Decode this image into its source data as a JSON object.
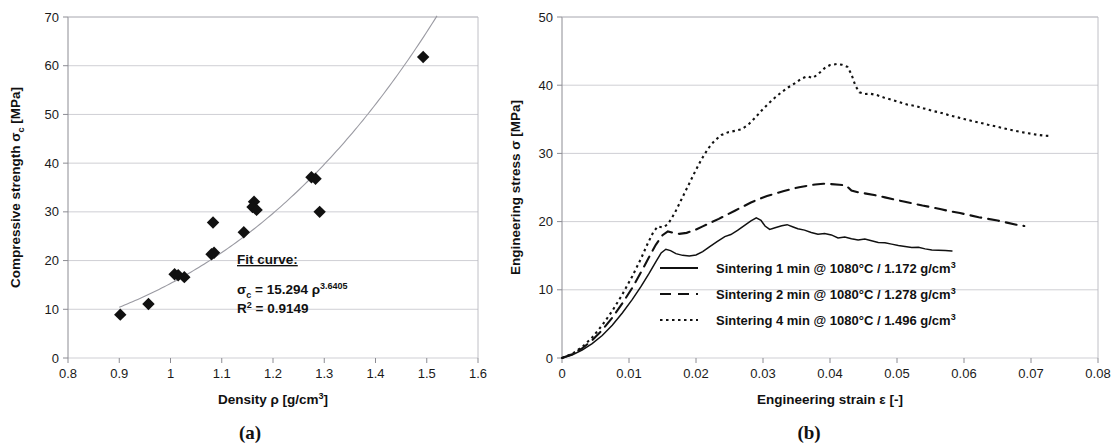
{
  "figure": {
    "panels": [
      {
        "caption": "(a)"
      },
      {
        "caption": "(b)"
      }
    ]
  },
  "chart_data": [
    {
      "type": "scatter",
      "panel": "a",
      "title": "",
      "xlabel": "Density ρ [g/cm³]",
      "xlabel_main": "Density ρ [g/cm",
      "xlabel_sup": "3",
      "xlabel_tail": "]",
      "ylabel_main": "Compressive strength σ",
      "ylabel_sub": "c",
      "ylabel_tail": " [MPa]",
      "ylabel": "Compressive strength σc [MPa]",
      "xlim": [
        0.8,
        1.6
      ],
      "ylim": [
        0,
        70
      ],
      "xticks": [
        "0.8",
        "0.9",
        "1",
        "1.1",
        "1.2",
        "1.3",
        "1.4",
        "1.5",
        "1.6"
      ],
      "xtick_values": [
        0.8,
        0.9,
        1.0,
        1.1,
        1.2,
        1.3,
        1.4,
        1.5,
        1.6
      ],
      "yticks": [
        "0",
        "10",
        "20",
        "30",
        "40",
        "50",
        "60",
        "70"
      ],
      "ytick_values": [
        0,
        10,
        20,
        30,
        40,
        50,
        60,
        70
      ],
      "grid": "horizontal",
      "marker": "diamond",
      "marker_color": "#111111",
      "points": [
        {
          "x": 0.902,
          "y": 8.9
        },
        {
          "x": 0.957,
          "y": 11.1
        },
        {
          "x": 1.008,
          "y": 17.2
        },
        {
          "x": 1.015,
          "y": 17.0
        },
        {
          "x": 1.027,
          "y": 16.6
        },
        {
          "x": 1.08,
          "y": 21.3
        },
        {
          "x": 1.085,
          "y": 21.6
        },
        {
          "x": 1.083,
          "y": 27.8
        },
        {
          "x": 1.143,
          "y": 25.8
        },
        {
          "x": 1.163,
          "y": 32.1
        },
        {
          "x": 1.16,
          "y": 31.0
        },
        {
          "x": 1.168,
          "y": 30.4
        },
        {
          "x": 1.275,
          "y": 37.1
        },
        {
          "x": 1.283,
          "y": 36.8
        },
        {
          "x": 1.291,
          "y": 30.0
        },
        {
          "x": 1.493,
          "y": 61.8
        }
      ],
      "fit": {
        "heading": "Fit curve:",
        "equation_lhs": "σ",
        "equation_lhs_sub": "c",
        "equation_mid": " = 15.294 ρ",
        "equation_exp": "3.6405",
        "coefficient": 15.294,
        "exponent": 3.6405,
        "r2_label": "R",
        "r2_sup": "2",
        "r2_value": " = 0.9149",
        "r_squared": 0.9149,
        "curve_xrange": [
          0.9,
          1.52
        ]
      }
    },
    {
      "type": "line",
      "panel": "b",
      "title": "",
      "xlabel_main": "Engineering strain ε [-]",
      "xlabel": "Engineering strain ε [-]",
      "ylabel": "Engineering stress σ [MPa]",
      "xlim": [
        0,
        0.08
      ],
      "ylim": [
        0,
        50
      ],
      "xticks": [
        "0",
        "0.01",
        "0.02",
        "0.03",
        "0.04",
        "0.05",
        "0.06",
        "0.07",
        "0.08"
      ],
      "xtick_values": [
        0,
        0.01,
        0.02,
        0.03,
        0.04,
        0.05,
        0.06,
        0.07,
        0.08
      ],
      "yticks": [
        "0",
        "10",
        "20",
        "30",
        "40",
        "50"
      ],
      "ytick_values": [
        0,
        10,
        20,
        30,
        40,
        50
      ],
      "grid": "horizontal",
      "legend_position": "center-right",
      "series": [
        {
          "name": "Sintering 1 min @ 1080°C / 1.172 g/cm³",
          "label_main": "Sintering 1 min @ 1080°C / 1.172 g/cm",
          "label_sup": "3",
          "dash": "solid",
          "color": "#111111",
          "points": [
            [
              0.0,
              0.0
            ],
            [
              0.0015,
              0.45
            ],
            [
              0.003,
              1.15
            ],
            [
              0.0045,
              2.1
            ],
            [
              0.006,
              3.3
            ],
            [
              0.0075,
              4.8
            ],
            [
              0.009,
              6.6
            ],
            [
              0.0105,
              8.6
            ],
            [
              0.0118,
              10.5
            ],
            [
              0.013,
              12.4
            ],
            [
              0.014,
              14.1
            ],
            [
              0.0148,
              15.4
            ],
            [
              0.0155,
              15.95
            ],
            [
              0.0162,
              15.75
            ],
            [
              0.017,
              15.3
            ],
            [
              0.018,
              15.05
            ],
            [
              0.019,
              14.95
            ],
            [
              0.02,
              15.1
            ],
            [
              0.021,
              15.6
            ],
            [
              0.022,
              16.3
            ],
            [
              0.0232,
              17.1
            ],
            [
              0.0243,
              17.8
            ],
            [
              0.0252,
              18.1
            ],
            [
              0.0262,
              18.7
            ],
            [
              0.0272,
              19.4
            ],
            [
              0.0282,
              20.1
            ],
            [
              0.029,
              20.55
            ],
            [
              0.0297,
              20.2
            ],
            [
              0.0303,
              19.35
            ],
            [
              0.031,
              18.85
            ],
            [
              0.0318,
              19.1
            ],
            [
              0.0328,
              19.4
            ],
            [
              0.0336,
              19.55
            ],
            [
              0.0344,
              19.25
            ],
            [
              0.0352,
              18.95
            ],
            [
              0.0362,
              18.75
            ],
            [
              0.0372,
              18.4
            ],
            [
              0.0382,
              18.15
            ],
            [
              0.0392,
              18.25
            ],
            [
              0.0402,
              18.05
            ],
            [
              0.0412,
              17.6
            ],
            [
              0.0422,
              17.75
            ],
            [
              0.0432,
              17.5
            ],
            [
              0.0442,
              17.3
            ],
            [
              0.0452,
              17.45
            ],
            [
              0.0462,
              17.2
            ],
            [
              0.0472,
              16.95
            ],
            [
              0.0482,
              16.9
            ],
            [
              0.0492,
              16.7
            ],
            [
              0.0502,
              16.5
            ],
            [
              0.0512,
              16.35
            ],
            [
              0.0522,
              16.2
            ],
            [
              0.0532,
              16.25
            ],
            [
              0.0542,
              16.0
            ],
            [
              0.0552,
              15.85
            ],
            [
              0.0562,
              15.8
            ],
            [
              0.0572,
              15.75
            ],
            [
              0.0582,
              15.7
            ]
          ]
        },
        {
          "name": "Sintering 2 min @ 1080°C / 1.278 g/cm³",
          "label_main": "Sintering 2 min @ 1080°C / 1.278 g/cm",
          "label_sup": "3",
          "dash": "dashed",
          "color": "#111111",
          "points": [
            [
              0.0,
              0.0
            ],
            [
              0.0015,
              0.55
            ],
            [
              0.003,
              1.4
            ],
            [
              0.0045,
              2.6
            ],
            [
              0.006,
              4.1
            ],
            [
              0.0075,
              5.9
            ],
            [
              0.009,
              8.0
            ],
            [
              0.0105,
              10.3
            ],
            [
              0.0118,
              12.6
            ],
            [
              0.013,
              14.8
            ],
            [
              0.014,
              16.6
            ],
            [
              0.015,
              18.0
            ],
            [
              0.0158,
              18.55
            ],
            [
              0.0166,
              18.35
            ],
            [
              0.0175,
              18.2
            ],
            [
              0.0186,
              18.35
            ],
            [
              0.0198,
              18.75
            ],
            [
              0.021,
              19.3
            ],
            [
              0.0222,
              19.85
            ],
            [
              0.0234,
              20.4
            ],
            [
              0.0246,
              21.0
            ],
            [
              0.0258,
              21.6
            ],
            [
              0.027,
              22.2
            ],
            [
              0.0282,
              22.8
            ],
            [
              0.0294,
              23.3
            ],
            [
              0.0306,
              23.75
            ],
            [
              0.0318,
              24.1
            ],
            [
              0.033,
              24.45
            ],
            [
              0.0342,
              24.75
            ],
            [
              0.0354,
              25.05
            ],
            [
              0.0366,
              25.25
            ],
            [
              0.0378,
              25.45
            ],
            [
              0.039,
              25.55
            ],
            [
              0.0402,
              25.5
            ],
            [
              0.0414,
              25.4
            ],
            [
              0.0424,
              25.3
            ],
            [
              0.0432,
              24.55
            ],
            [
              0.0442,
              24.3
            ],
            [
              0.0454,
              24.1
            ],
            [
              0.0468,
              23.85
            ],
            [
              0.0482,
              23.55
            ],
            [
              0.0496,
              23.25
            ],
            [
              0.051,
              22.95
            ],
            [
              0.0524,
              22.65
            ],
            [
              0.0538,
              22.35
            ],
            [
              0.0552,
              22.1
            ],
            [
              0.0566,
              21.8
            ],
            [
              0.058,
              21.5
            ],
            [
              0.0594,
              21.25
            ],
            [
              0.0608,
              20.95
            ],
            [
              0.0622,
              20.65
            ],
            [
              0.0636,
              20.4
            ],
            [
              0.065,
              20.15
            ],
            [
              0.0664,
              19.85
            ],
            [
              0.0678,
              19.55
            ],
            [
              0.069,
              19.35
            ]
          ]
        },
        {
          "name": "Sintering 4 min @ 1080°C / 1.496 g/cm³",
          "label_main": "Sintering 4 min @ 1080°C / 1.496 g/cm",
          "label_sup": "3",
          "dash": "dotted",
          "color": "#111111",
          "points": [
            [
              0.0,
              0.0
            ],
            [
              0.0015,
              0.6
            ],
            [
              0.003,
              1.6
            ],
            [
              0.0045,
              3.0
            ],
            [
              0.006,
              4.8
            ],
            [
              0.0075,
              6.9
            ],
            [
              0.009,
              9.3
            ],
            [
              0.0105,
              12.0
            ],
            [
              0.0118,
              14.6
            ],
            [
              0.0128,
              16.8
            ],
            [
              0.0136,
              18.4
            ],
            [
              0.0143,
              19.3
            ],
            [
              0.015,
              19.15
            ],
            [
              0.0158,
              19.6
            ],
            [
              0.0168,
              21.2
            ],
            [
              0.0178,
              23.2
            ],
            [
              0.0188,
              25.2
            ],
            [
              0.0198,
              27.2
            ],
            [
              0.0208,
              29.1
            ],
            [
              0.0218,
              30.7
            ],
            [
              0.0228,
              31.9
            ],
            [
              0.0238,
              32.7
            ],
            [
              0.0248,
              33.1
            ],
            [
              0.0258,
              33.3
            ],
            [
              0.0268,
              33.55
            ],
            [
              0.0278,
              34.2
            ],
            [
              0.0288,
              35.2
            ],
            [
              0.0298,
              36.3
            ],
            [
              0.0308,
              37.3
            ],
            [
              0.0318,
              38.2
            ],
            [
              0.0328,
              39.0
            ],
            [
              0.0338,
              39.7
            ],
            [
              0.0348,
              40.3
            ],
            [
              0.0358,
              41.0
            ],
            [
              0.0366,
              41.3
            ],
            [
              0.0374,
              41.05
            ],
            [
              0.0382,
              41.6
            ],
            [
              0.0392,
              42.5
            ],
            [
              0.04,
              42.95
            ],
            [
              0.041,
              43.1
            ],
            [
              0.0418,
              43.0
            ],
            [
              0.0426,
              42.7
            ],
            [
              0.0432,
              41.6
            ],
            [
              0.0438,
              39.9
            ],
            [
              0.0444,
              38.95
            ],
            [
              0.0452,
              38.7
            ],
            [
              0.046,
              38.75
            ],
            [
              0.047,
              38.55
            ],
            [
              0.048,
              38.2
            ],
            [
              0.0492,
              37.85
            ],
            [
              0.0504,
              37.5
            ],
            [
              0.0516,
              37.15
            ],
            [
              0.0528,
              36.95
            ],
            [
              0.054,
              36.6
            ],
            [
              0.0552,
              36.25
            ],
            [
              0.0564,
              36.0
            ],
            [
              0.0576,
              35.65
            ],
            [
              0.0588,
              35.35
            ],
            [
              0.06,
              35.05
            ],
            [
              0.0612,
              34.75
            ],
            [
              0.0624,
              34.5
            ],
            [
              0.0636,
              34.2
            ],
            [
              0.0648,
              33.95
            ],
            [
              0.066,
              33.65
            ],
            [
              0.0672,
              33.4
            ],
            [
              0.0684,
              33.15
            ],
            [
              0.0696,
              32.95
            ],
            [
              0.0708,
              32.75
            ],
            [
              0.072,
              32.6
            ],
            [
              0.073,
              32.55
            ]
          ]
        }
      ]
    }
  ]
}
